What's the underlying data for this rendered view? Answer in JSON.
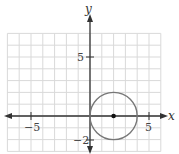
{
  "chart_data": {
    "type": "scatter",
    "title": "",
    "xlabel": "x",
    "ylabel": "y",
    "xlim": [
      -7,
      6
    ],
    "ylim": [
      -3,
      7
    ],
    "grid": true,
    "x_tick_labels": [
      "-5",
      "5"
    ],
    "y_tick_labels": [
      "5",
      "-2"
    ],
    "shapes": [
      {
        "type": "circle",
        "center": [
          2,
          0
        ],
        "radius": 2,
        "stroke": "#777777"
      }
    ],
    "points": [
      {
        "x": 2,
        "y": 0,
        "label": "center"
      }
    ]
  },
  "labels": {
    "x_axis": "x",
    "y_axis": "y",
    "x_neg5": "−5",
    "x_pos5": "5",
    "y_pos5": "5",
    "y_neg2": "−2"
  }
}
